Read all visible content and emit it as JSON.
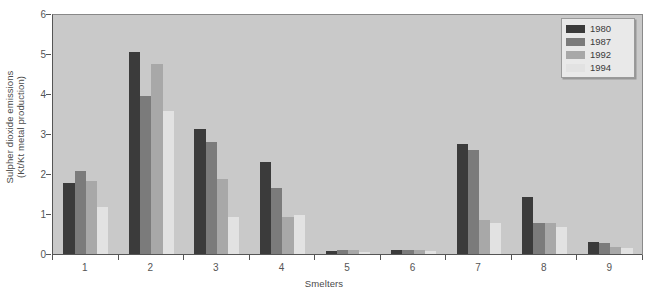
{
  "chart_data": {
    "type": "bar",
    "title": "",
    "xlabel": "Smelters",
    "ylabel": "Sulpher dioxide emissions (Kt/Kt metal production)",
    "ylabel_line1": "Sulpher dioxide emissions",
    "ylabel_line2": "(Kt/Kt metal production)",
    "categories": [
      "1",
      "2",
      "3",
      "4",
      "5",
      "6",
      "7",
      "8",
      "9"
    ],
    "ylim": [
      0,
      6
    ],
    "yticks": [
      0,
      1,
      2,
      3,
      4,
      5,
      6
    ],
    "ytick_labels": [
      "0",
      "1",
      "2",
      "3",
      "4",
      "5",
      "6"
    ],
    "grid": false,
    "legend_position": "top-right",
    "series": [
      {
        "name": "1980",
        "color": "#3b3b3b",
        "values": [
          1.8,
          5.08,
          3.15,
          2.32,
          0.1,
          0.13,
          2.78,
          1.45,
          0.33
        ]
      },
      {
        "name": "1987",
        "color": "#7b7b7b",
        "values": [
          2.1,
          3.97,
          2.82,
          1.67,
          0.12,
          0.12,
          2.62,
          0.8,
          0.3
        ]
      },
      {
        "name": "1992",
        "color": "#a8a8a8",
        "values": [
          1.85,
          4.78,
          1.9,
          0.95,
          0.12,
          0.12,
          0.88,
          0.8,
          0.2
        ]
      },
      {
        "name": "1994",
        "color": "#e2e2e2",
        "values": [
          1.2,
          3.6,
          0.95,
          1.0,
          0.08,
          0.1,
          0.8,
          0.7,
          0.17
        ]
      }
    ]
  },
  "legend": {
    "items": [
      {
        "label": "1980"
      },
      {
        "label": "1987"
      },
      {
        "label": "1992"
      },
      {
        "label": "1994"
      }
    ]
  },
  "colors": {
    "plot_background": "#c9c9c9",
    "page_background": "#ffffff",
    "axis": "#555555",
    "text": "#4a4a4a",
    "legend_background": "#e9e9e9"
  }
}
